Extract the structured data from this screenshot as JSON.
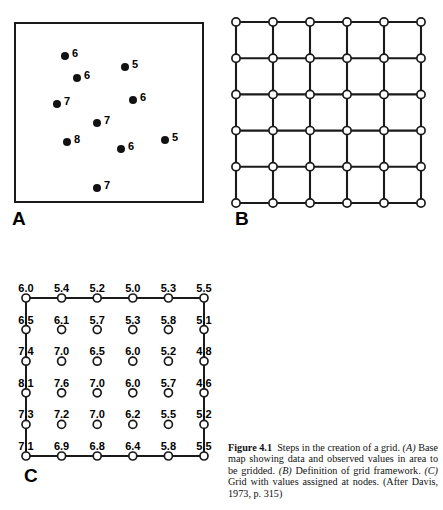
{
  "header": {
    "running_header": ""
  },
  "figure": {
    "label_a": "A",
    "label_b": "B",
    "label_c": "C",
    "caption_number": "Figure 4.1",
    "caption_lead": "Steps in the creation of a grid.",
    "caption_a_tag": "(A)",
    "caption_a_text": "Base map showing data and observed values in area to be gridded.",
    "caption_b_tag": "(B)",
    "caption_b_text": "Definition of grid framework.",
    "caption_c_tag": "(C)",
    "caption_c_text": "Grid with values assigned at nodes.",
    "caption_source": "(After Davis, 1973, p. 315)"
  },
  "colors": {
    "ink": "#121212",
    "paper": "#ffffff",
    "rule": "#1a1a1a"
  },
  "chart_data": [
    {
      "type": "scatter",
      "panel": "A",
      "title": "Base map showing data and observed values in area to be gridded",
      "xlabel": "",
      "ylabel": "",
      "xlim": [
        0,
        190
      ],
      "ylim": [
        0,
        181
      ],
      "grid": false,
      "legend": "none",
      "marker": "filled-circle",
      "points": [
        {
          "x": 47,
          "y": 30,
          "label": "6"
        },
        {
          "x": 59,
          "y": 52,
          "label": "6"
        },
        {
          "x": 39,
          "y": 78,
          "label": "7"
        },
        {
          "x": 107,
          "y": 41,
          "label": "5"
        },
        {
          "x": 115,
          "y": 74,
          "label": "6"
        },
        {
          "x": 79,
          "y": 97,
          "label": "7"
        },
        {
          "x": 49,
          "y": 116,
          "label": "8"
        },
        {
          "x": 103,
          "y": 123,
          "label": "6"
        },
        {
          "x": 147,
          "y": 114,
          "label": "5"
        },
        {
          "x": 79,
          "y": 162,
          "label": "7"
        }
      ]
    },
    {
      "type": "heatmap",
      "panel": "B",
      "title": "Definition of grid framework",
      "xlabel": "",
      "ylabel": "",
      "grid": true,
      "legend": "none",
      "marker": "open-circle",
      "rows": 6,
      "cols": 6,
      "values": [
        [
          "",
          "",
          "",
          "",
          "",
          ""
        ],
        [
          "",
          "",
          "",
          "",
          "",
          ""
        ],
        [
          "",
          "",
          "",
          "",
          "",
          ""
        ],
        [
          "",
          "",
          "",
          "",
          "",
          ""
        ],
        [
          "",
          "",
          "",
          "",
          "",
          ""
        ],
        [
          "",
          "",
          "",
          "",
          "",
          ""
        ]
      ]
    },
    {
      "type": "heatmap",
      "panel": "C",
      "title": "Grid with values assigned at nodes",
      "xlabel": "",
      "ylabel": "",
      "grid": false,
      "legend": "none",
      "marker": "open-circle",
      "rows": 6,
      "cols": 6,
      "values": [
        [
          "6.0",
          "5.4",
          "5.2",
          "5.0",
          "5.3",
          "5.5"
        ],
        [
          "6.5",
          "6.1",
          "5.7",
          "5.3",
          "5.8",
          "5.1"
        ],
        [
          "7.4",
          "7.0",
          "6.5",
          "6.0",
          "5.2",
          "4.8"
        ],
        [
          "8.1",
          "7.6",
          "7.0",
          "6.0",
          "5.7",
          "4.6"
        ],
        [
          "7.3",
          "7.2",
          "7.0",
          "6.2",
          "5.5",
          "5.2"
        ],
        [
          "7.1",
          "6.9",
          "6.8",
          "6.4",
          "5.8",
          "5.5"
        ]
      ]
    }
  ]
}
